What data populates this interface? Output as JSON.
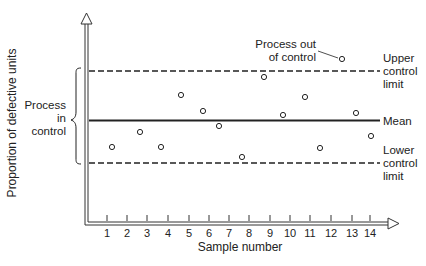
{
  "chart_data": {
    "type": "scatter",
    "title": "",
    "xlabel": "Sample number",
    "ylabel": "Proportion of defective units",
    "categories": [
      "1",
      "2",
      "3",
      "4",
      "5",
      "6",
      "7",
      "8",
      "9",
      "10",
      "11",
      "12",
      "13",
      "14"
    ],
    "x": [
      1,
      2,
      3,
      4,
      5,
      6,
      7,
      8,
      9,
      10,
      11,
      12,
      13,
      14
    ],
    "values": [
      0.35,
      0.43,
      0.35,
      0.63,
      0.55,
      0.47,
      0.3,
      0.75,
      0.52,
      0.62,
      0.34,
      0.85,
      0.53,
      0.41
    ],
    "ylim": [
      0,
      1
    ],
    "reference_lines": {
      "upper_control_limit": 0.78,
      "mean": 0.52,
      "lower_control_limit": 0.27
    },
    "grid": false,
    "legend": "none",
    "annotations": [
      {
        "text": "Process out of control",
        "target_sample": 12
      },
      {
        "text": "Process in control",
        "range": "between lower and upper control limits"
      },
      {
        "text": "Upper control limit"
      },
      {
        "text": "Mean"
      },
      {
        "text": "Lower control limit"
      }
    ]
  },
  "axes": {
    "xlabel": "Sample number",
    "ylabel": "Proportion of defective units",
    "ticks": [
      "1",
      "2",
      "3",
      "4",
      "5",
      "6",
      "7",
      "8",
      "9",
      "10",
      "11",
      "12",
      "13",
      "14"
    ]
  },
  "labels": {
    "upper_line1": "Upper",
    "upper_line2": "control",
    "upper_line3": "limit",
    "mean": "Mean",
    "lower_line1": "Lower",
    "lower_line2": "control",
    "lower_line3": "limit",
    "out_line1": "Process out",
    "out_line2": "of control",
    "in_line1": "Process",
    "in_line2": "in",
    "in_line3": "control"
  },
  "layout": {
    "tick_x": [
      107,
      127,
      147,
      168,
      189,
      209,
      229,
      249,
      270,
      290,
      310,
      331,
      352,
      370
    ],
    "point_x": [
      112,
      140,
      161,
      181,
      203,
      219,
      242,
      264,
      283,
      305,
      320,
      342,
      356,
      371
    ],
    "point_y": [
      147,
      132,
      147,
      95,
      111,
      126,
      157,
      77,
      115,
      97,
      148,
      59,
      113,
      136
    ]
  }
}
